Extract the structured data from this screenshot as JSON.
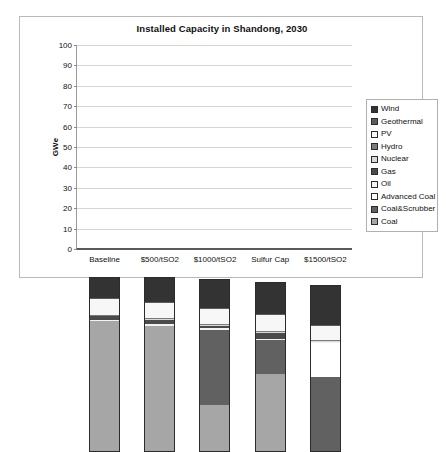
{
  "chart_data": {
    "type": "bar",
    "subtype": "stacked-column",
    "title": "Installed Capacity in Shandong, 2030",
    "xlabel": "",
    "ylabel": "GWe",
    "ylim": [
      0,
      100
    ],
    "ytick_step": 10,
    "yticks": [
      0,
      10,
      20,
      30,
      40,
      50,
      60,
      70,
      80,
      90,
      100
    ],
    "ytick_labels": [
      "0",
      "10",
      "20",
      "30",
      "40",
      "50",
      "60",
      "70",
      "80",
      "90",
      "100"
    ],
    "grid": true,
    "legend_position": "right",
    "categories": [
      "Baseline",
      "$500/tSO2",
      "$1000/tSO2",
      "Sulfur Cap",
      "$1500/tSO2"
    ],
    "series": [
      {
        "name": "Coal",
        "color": "#a6a6a6",
        "values": [
          64.0,
          62.0,
          23.0,
          38.0,
          0.0
        ]
      },
      {
        "name": "Coal&Scrubber",
        "color": "#616161",
        "values": [
          0.0,
          0.0,
          37.0,
          17.0,
          37.0
        ]
      },
      {
        "name": "Advanced Coal",
        "color": "#ffffff",
        "values": [
          0.0,
          0.0,
          0.0,
          0.0,
          16.5
        ]
      },
      {
        "name": "Oil",
        "color": "#f2f2f2",
        "values": [
          0.6,
          0.6,
          0.6,
          0.6,
          0.6
        ]
      },
      {
        "name": "Gas",
        "color": "#4a4a4a",
        "values": [
          2.0,
          2.2,
          1.3,
          3.0,
          0.0
        ]
      },
      {
        "name": "Nuclear",
        "color": "#d9d9d9",
        "values": [
          0.4,
          0.4,
          0.4,
          0.4,
          0.4
        ]
      },
      {
        "name": "Hydro",
        "color": "#7a7a7a",
        "values": [
          0.4,
          0.4,
          0.4,
          0.4,
          0.4
        ]
      },
      {
        "name": "PV",
        "color": "#f7f7f7",
        "values": [
          7.6,
          7.3,
          7.3,
          7.6,
          7.0
        ]
      },
      {
        "name": "Geothermal",
        "color": "#5c5c5c",
        "values": [
          0.5,
          0.5,
          0.5,
          0.5,
          0.5
        ]
      },
      {
        "name": "Wind",
        "color": "#333333",
        "values": [
          10.2,
          12.3,
          14.5,
          15.9,
          19.3
        ]
      }
    ],
    "totals": [
      85.7,
      85.7,
      85.0,
      83.4,
      81.7
    ],
    "legend_entries": [
      {
        "label": "Wind",
        "color": "#333333"
      },
      {
        "label": "Geothermal",
        "color": "#5c5c5c"
      },
      {
        "label": "PV",
        "color": "#f7f7f7"
      },
      {
        "label": "Hydro",
        "color": "#7a7a7a"
      },
      {
        "label": "Nuclear",
        "color": "#d9d9d9"
      },
      {
        "label": "Gas",
        "color": "#4a4a4a"
      },
      {
        "label": "Oil",
        "color": "#f2f2f2"
      },
      {
        "label": "Advanced Coal",
        "color": "#ffffff"
      },
      {
        "label": "Coal&Scrubber",
        "color": "#616161"
      },
      {
        "label": "Coal",
        "color": "#a6a6a6"
      }
    ]
  }
}
